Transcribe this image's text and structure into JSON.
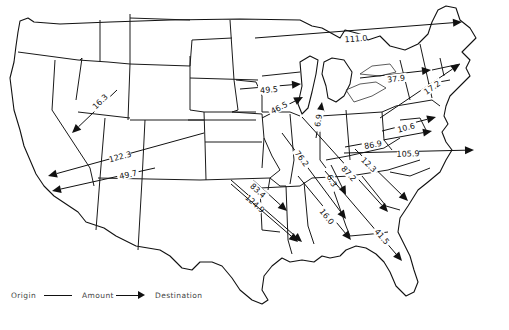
{
  "map": {
    "subject": "Flow map of the contiguous United States showing amounts moving from origin to destination",
    "flows": [
      {
        "id": "f1",
        "amount": "111.0",
        "x1": 255,
        "y1": 38,
        "x2": 462,
        "y2": 22,
        "lx": 356,
        "ly": 40
      },
      {
        "id": "f2",
        "amount": "16.3",
        "x1": 117,
        "y1": 90,
        "x2": 72,
        "y2": 133,
        "lx": 100,
        "ly": 103
      },
      {
        "id": "f3",
        "amount": "122.3",
        "x1": 204,
        "y1": 133,
        "x2": 48,
        "y2": 176,
        "lx": 120,
        "ly": 158
      },
      {
        "id": "f4",
        "amount": "49.7",
        "x1": 155,
        "y1": 168,
        "x2": 52,
        "y2": 191,
        "lx": 128,
        "ly": 176
      },
      {
        "id": "f5",
        "amount": "49.5",
        "x1": 240,
        "y1": 89,
        "x2": 301,
        "y2": 84,
        "lx": 269,
        "ly": 91
      },
      {
        "id": "f6",
        "amount": "46.5",
        "x1": 262,
        "y1": 118,
        "x2": 303,
        "y2": 97,
        "lx": 279,
        "ly": 109
      },
      {
        "id": "f7",
        "amount": "6.9",
        "x1": 316,
        "y1": 138,
        "x2": 322,
        "y2": 102,
        "lx": 318,
        "ly": 122
      },
      {
        "id": "f8",
        "amount": "37.9",
        "x1": 360,
        "y1": 78,
        "x2": 431,
        "y2": 70,
        "lx": 396,
        "ly": 80
      },
      {
        "id": "f9",
        "amount": "17.2",
        "x1": 380,
        "y1": 118,
        "x2": 460,
        "y2": 64,
        "lx": 432,
        "ly": 89
      },
      {
        "id": "f10",
        "amount": "10.6",
        "x1": 382,
        "y1": 131,
        "x2": 436,
        "y2": 117,
        "lx": 406,
        "ly": 129
      },
      {
        "id": "f11",
        "amount": "86.9",
        "x1": 345,
        "y1": 147,
        "x2": 432,
        "y2": 131,
        "lx": 373,
        "ly": 146
      },
      {
        "id": "f12",
        "amount": "105.9",
        "x1": 344,
        "y1": 153,
        "x2": 474,
        "y2": 150,
        "lx": 408,
        "ly": 155
      },
      {
        "id": "f13",
        "amount": "12.3",
        "x1": 355,
        "y1": 149,
        "x2": 408,
        "y2": 201,
        "lx": 369,
        "ly": 166
      },
      {
        "id": "f14",
        "amount": "87.2",
        "x1": 302,
        "y1": 117,
        "x2": 388,
        "y2": 212,
        "lx": 349,
        "ly": 175
      },
      {
        "id": "f15",
        "amount": "76.2",
        "x1": 282,
        "y1": 133,
        "x2": 346,
        "y2": 219,
        "lx": 302,
        "ly": 160
      },
      {
        "id": "f16",
        "amount": "6.3",
        "x1": 331,
        "y1": 165,
        "x2": 346,
        "y2": 195,
        "lx": 332,
        "ly": 182
      },
      {
        "id": "f17",
        "amount": "16.0",
        "x1": 298,
        "y1": 176,
        "x2": 351,
        "y2": 240,
        "lx": 327,
        "ly": 218
      },
      {
        "id": "f18",
        "amount": "41.5",
        "x1": 325,
        "y1": 171,
        "x2": 402,
        "y2": 261,
        "lx": 382,
        "ly": 238
      },
      {
        "id": "f19",
        "amount": "83.4",
        "x1": 253,
        "y1": 180,
        "x2": 287,
        "y2": 211,
        "lx": 258,
        "ly": 192
      },
      {
        "id": "f20",
        "amount": "124.9",
        "x1": 231,
        "y1": 180,
        "x2": 302,
        "y2": 242,
        "lx": 255,
        "ly": 205
      },
      {
        "id": "f21",
        "amount": "",
        "x1": 231,
        "y1": 184,
        "x2": 298,
        "y2": 242,
        "lx": 0,
        "ly": 0
      }
    ]
  },
  "legend": {
    "origin": "Origin",
    "amount": "Amount",
    "destination": "Destination"
  }
}
